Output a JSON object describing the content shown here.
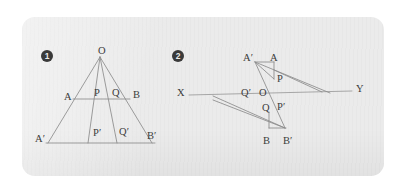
{
  "panel": {
    "background_color": "#ebebeb",
    "page_background_color": "#ffffff",
    "line_color": "#8b8b8b",
    "label_color": "#3b3b3b",
    "marker_color": "#3a3a3a"
  },
  "figures": [
    {
      "id": "figure-1",
      "marker": "1",
      "description": "Pencil of four rays from apex O cut by two parallel transversals",
      "labels": [
        {
          "name": "point-label-O",
          "text": "O",
          "x": 98,
          "y": 46
        },
        {
          "name": "point-label-A",
          "text": "A",
          "x": 64,
          "y": 92
        },
        {
          "name": "point-label-P",
          "text": "P",
          "x": 94,
          "y": 88
        },
        {
          "name": "point-label-Q",
          "text": "Q",
          "x": 112,
          "y": 88
        },
        {
          "name": "point-label-B",
          "text": "B",
          "x": 133,
          "y": 90
        },
        {
          "name": "point-label-A-prime",
          "text": "A′",
          "x": 35,
          "y": 134
        },
        {
          "name": "point-label-P-prime",
          "text": "P′",
          "x": 93,
          "y": 128
        },
        {
          "name": "point-label-Q-prime",
          "text": "Q′",
          "x": 119,
          "y": 127
        },
        {
          "name": "point-label-B-prime",
          "text": "B′",
          "x": 147,
          "y": 131
        }
      ],
      "marker_pos": {
        "x": 41,
        "y": 50
      }
    },
    {
      "id": "figure-2",
      "marker": "2",
      "description": "Line X Y with crossed transversals meeting at A A-prime above and B B-prime below",
      "labels": [
        {
          "name": "point-label-X",
          "text": "X",
          "x": 177,
          "y": 88
        },
        {
          "name": "point-label-Y",
          "text": "Y",
          "x": 356,
          "y": 84
        },
        {
          "name": "point-label-A-prime-2",
          "text": "A′",
          "x": 243,
          "y": 53
        },
        {
          "name": "point-label-A-2",
          "text": "A",
          "x": 270,
          "y": 53
        },
        {
          "name": "point-label-P-2",
          "text": "P",
          "x": 277,
          "y": 74
        },
        {
          "name": "point-label-Q-prime-2",
          "text": "Q′",
          "x": 241,
          "y": 88
        },
        {
          "name": "point-label-O-2",
          "text": "O",
          "x": 259,
          "y": 88
        },
        {
          "name": "point-label-Q-2",
          "text": "Q",
          "x": 262,
          "y": 103
        },
        {
          "name": "point-label-P-prime-2",
          "text": "P′",
          "x": 277,
          "y": 102
        },
        {
          "name": "point-label-B-2",
          "text": "B",
          "x": 263,
          "y": 136
        },
        {
          "name": "point-label-B-prime-2",
          "text": "B′",
          "x": 283,
          "y": 136
        }
      ],
      "marker_pos": {
        "x": 172,
        "y": 50
      }
    }
  ]
}
